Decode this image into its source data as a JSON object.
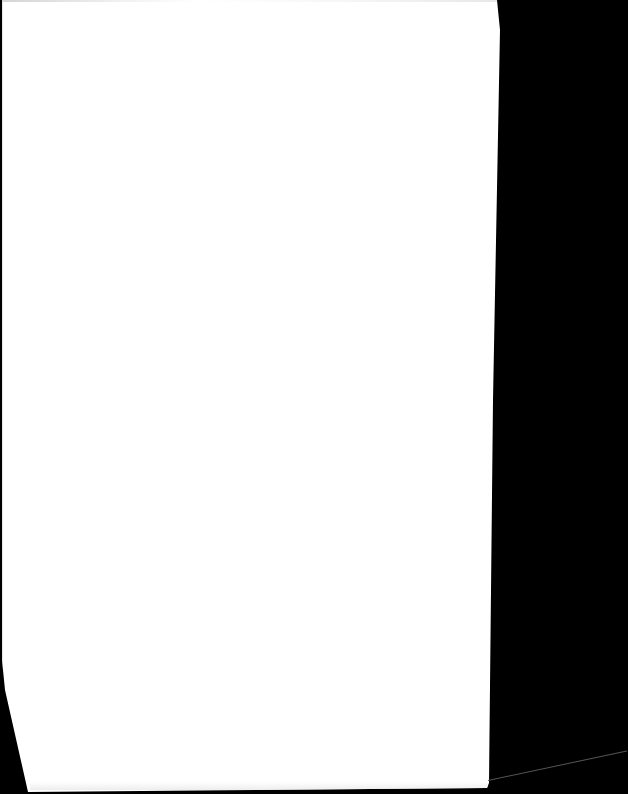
{
  "document": {
    "type": "scanned-page",
    "page_state": "blank",
    "text_blocks": []
  },
  "colors": {
    "background": "#000000",
    "paper": "#ffffff",
    "scanner_line": "#555555"
  }
}
